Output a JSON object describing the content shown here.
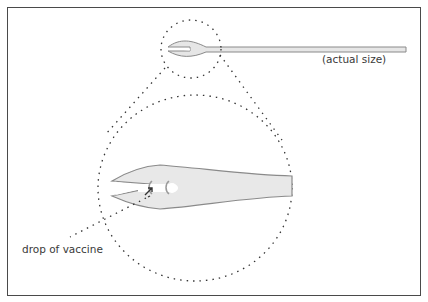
{
  "figure": {
    "type": "illustration",
    "labels": {
      "actual_size": "(actual size)",
      "drop_of_vaccine": "drop of vaccine"
    },
    "colors": {
      "border": "#4a4a4a",
      "needle_fill": "#e6e6e6",
      "needle_outline": "#8a8a8a",
      "dotted_lines": "#333333",
      "text": "#3a3a3a"
    }
  }
}
